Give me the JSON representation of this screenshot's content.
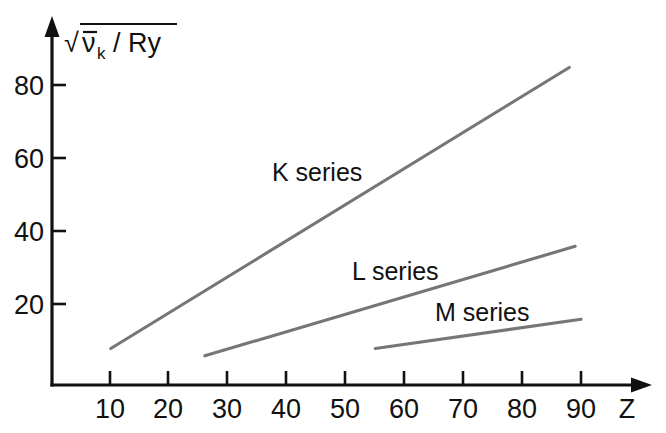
{
  "chart_data": {
    "type": "line",
    "title": "",
    "xlabel": "Z",
    "ylabel": "sqrt(v-bar_k / Ry)",
    "ylabel_parts": {
      "radical": "√",
      "symbol": "ν",
      "subscript": "k",
      "divider": "/ Ry"
    },
    "xlim": [
      0,
      95
    ],
    "ylim": [
      0,
      95
    ],
    "grid": false,
    "legend": "inline-annotations",
    "xticks": [
      10,
      20,
      30,
      40,
      50,
      60,
      70,
      80,
      90
    ],
    "xtick_labels": [
      "10",
      "20",
      "30",
      "40",
      "50",
      "60",
      "70",
      "80",
      "90"
    ],
    "yticks": [
      20,
      40,
      60,
      80
    ],
    "ytick_labels": [
      "20",
      "40",
      "60",
      "80"
    ],
    "series": [
      {
        "name": "K series",
        "label": "K series",
        "color": "#767676",
        "x": [
          10,
          88
        ],
        "values": [
          10,
          87
        ],
        "label_x": 34,
        "label_y": 58
      },
      {
        "name": "L series",
        "label": "L series",
        "color": "#767676",
        "x": [
          26,
          89
        ],
        "values": [
          8,
          38
        ],
        "label_x": 47,
        "label_y": 32
      },
      {
        "name": "M series",
        "label": "M series",
        "color": "#767676",
        "x": [
          55,
          90
        ],
        "values": [
          10,
          18
        ],
        "label_x": 60,
        "label_y": 22
      }
    ]
  },
  "figure": {
    "axis_color": "#111111",
    "background": "#ffffff"
  }
}
